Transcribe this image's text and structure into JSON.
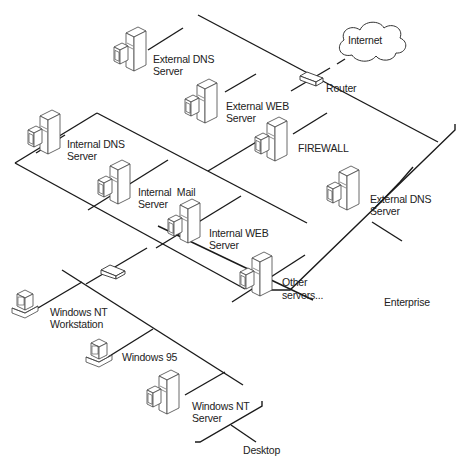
{
  "diagram": {
    "type": "network-topology",
    "colors": {
      "line": "#1a1a1a",
      "stroke": "#444444",
      "fill": "#ffffff",
      "text": "#222222"
    },
    "nodes": [
      {
        "id": "internet",
        "kind": "cloud",
        "label": "Internet"
      },
      {
        "id": "router",
        "kind": "router",
        "label": "Router"
      },
      {
        "id": "ext_dns_1",
        "kind": "server",
        "label_line1": "External DNS",
        "label_line2": "Server"
      },
      {
        "id": "ext_web",
        "kind": "server",
        "label_line1": "External WEB",
        "label_line2": "Server"
      },
      {
        "id": "firewall",
        "kind": "server",
        "label_line1": "FIREWALL",
        "label_line2": ""
      },
      {
        "id": "ext_dns_2",
        "kind": "server",
        "label_line1": "External DNS",
        "label_line2": "Server"
      },
      {
        "id": "int_dns",
        "kind": "server",
        "label_line1": "Internal DNS",
        "label_line2": "Server"
      },
      {
        "id": "int_mail",
        "kind": "server",
        "label_line1": "Internal  Mail",
        "label_line2": "Server"
      },
      {
        "id": "int_web",
        "kind": "server",
        "label_line1": "Internal WEB",
        "label_line2": "Server"
      },
      {
        "id": "other",
        "kind": "server",
        "label_line1": "Other",
        "label_line2": "servers..."
      },
      {
        "id": "hub",
        "kind": "hub",
        "label": ""
      },
      {
        "id": "nt_ws",
        "kind": "workstation",
        "label_line1": "Windows NT",
        "label_line2": "Workstation"
      },
      {
        "id": "win95",
        "kind": "workstation",
        "label_line1": "Windows 95",
        "label_line2": ""
      },
      {
        "id": "nt_server",
        "kind": "server",
        "label_line1": "Windows NT",
        "label_line2": "Server"
      }
    ],
    "zones": [
      {
        "id": "enterprise",
        "label": "Enterprise"
      },
      {
        "id": "desktop",
        "label": "Desktop"
      }
    ]
  }
}
